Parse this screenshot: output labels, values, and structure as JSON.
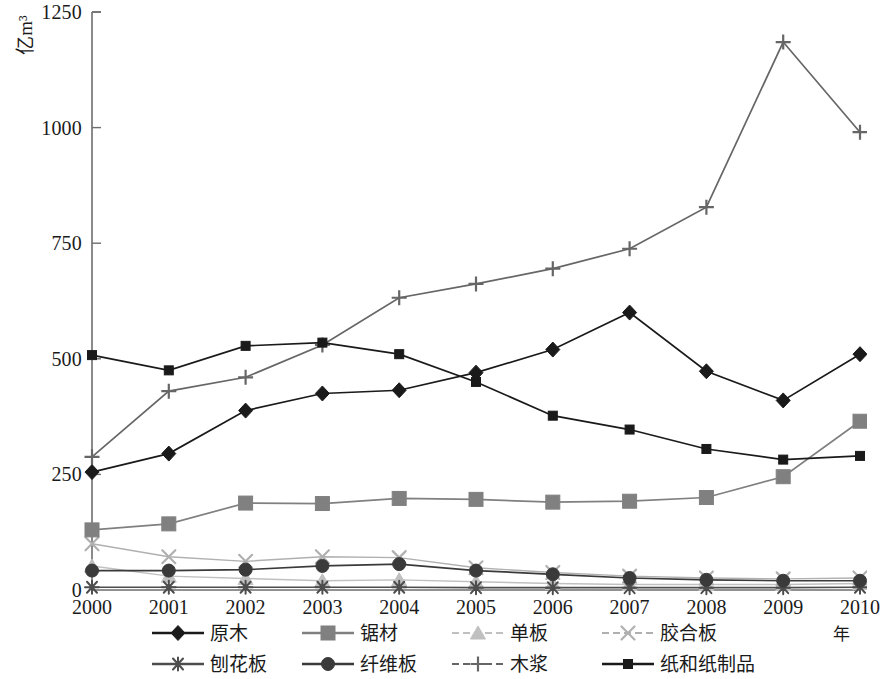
{
  "chart_data": {
    "type": "line",
    "title": "",
    "xlabel": "年",
    "ylabel": "亿m³",
    "categories": [
      "2000",
      "2001",
      "2002",
      "2003",
      "2004",
      "2005",
      "2006",
      "2007",
      "2008",
      "2009",
      "2010"
    ],
    "x": [
      2000,
      2001,
      2002,
      2003,
      2004,
      2005,
      2006,
      2007,
      2008,
      2009,
      2010
    ],
    "ylim": [
      0,
      1250
    ],
    "yticks": [
      0,
      250,
      500,
      750,
      1000,
      1250
    ],
    "ytick_labels": [
      "0",
      "250",
      "500",
      "750",
      "1000",
      "1250"
    ],
    "grid": false,
    "legend_position": "bottom",
    "series": [
      {
        "name": "原木",
        "marker": "diamond",
        "color": "#1a1a1a",
        "values": [
          255,
          295,
          388,
          425,
          432,
          470,
          520,
          600,
          473,
          410,
          510
        ]
      },
      {
        "name": "锯材",
        "marker": "square",
        "color": "#808080",
        "values": [
          130,
          143,
          188,
          187,
          198,
          196,
          190,
          192,
          200,
          245,
          365
        ]
      },
      {
        "name": "单板",
        "marker": "triangle",
        "color": "#c0c0c0",
        "values": [
          52,
          30,
          25,
          20,
          22,
          18,
          14,
          12,
          12,
          12,
          14
        ]
      },
      {
        "name": "胶合板",
        "marker": "x",
        "color": "#b0b0b0",
        "values": [
          100,
          72,
          62,
          72,
          70,
          48,
          38,
          30,
          26,
          24,
          26
        ]
      },
      {
        "name": "刨花板",
        "marker": "star",
        "color": "#4d4d4d",
        "values": [
          6,
          6,
          6,
          6,
          6,
          5,
          5,
          5,
          5,
          5,
          6
        ]
      },
      {
        "name": "纤维板",
        "marker": "circle",
        "color": "#3a3a3a",
        "values": [
          42,
          42,
          44,
          52,
          56,
          42,
          34,
          26,
          22,
          20,
          20
        ]
      },
      {
        "name": "木浆",
        "marker": "plus",
        "color": "#666666",
        "values": [
          288,
          430,
          460,
          530,
          632,
          662,
          695,
          738,
          828,
          1185,
          990
        ]
      },
      {
        "name": "纸和纸制品",
        "marker": "smallsquare",
        "color": "#1a1a1a",
        "values": [
          508,
          475,
          528,
          535,
          510,
          450,
          377,
          347,
          305,
          282,
          290
        ]
      }
    ]
  },
  "axes": {
    "y_unit_label": "亿m³",
    "x_title": "年"
  },
  "legend": {
    "rows": [
      [
        {
          "label": "原木",
          "marker": "diamond",
          "color": "#1a1a1a"
        },
        {
          "label": "锯材",
          "marker": "square",
          "color": "#808080"
        },
        {
          "label": "单板",
          "marker": "triangle",
          "color": "#c0c0c0"
        },
        {
          "label": "胶合板",
          "marker": "x",
          "color": "#b0b0b0"
        }
      ],
      [
        {
          "label": "刨花板",
          "marker": "star",
          "color": "#4d4d4d"
        },
        {
          "label": "纤维板",
          "marker": "circle",
          "color": "#3a3a3a"
        },
        {
          "label": "木浆",
          "marker": "plus",
          "color": "#666666"
        },
        {
          "label": "纸和纸制品",
          "marker": "smallsquare",
          "color": "#1a1a1a"
        }
      ]
    ]
  }
}
